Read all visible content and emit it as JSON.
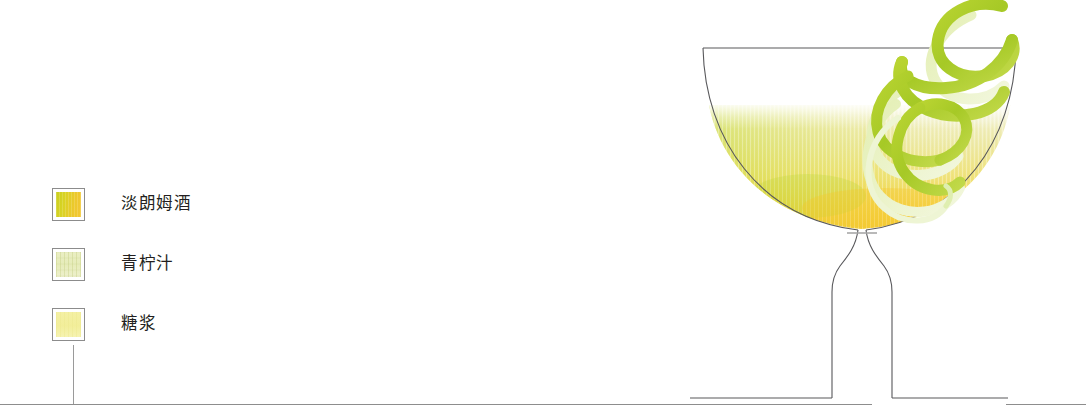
{
  "illustration": {
    "title": "Daiquiri cocktail cross-section illustration",
    "background_color": "#ffffff",
    "line_color": "#58585b"
  },
  "legend": {
    "items": [
      {
        "label": "淡朗姆酒",
        "swatch_name": "light-rum",
        "colors": [
          "#c9cf1f",
          "#d9d324",
          "#edc82c",
          "#f3c733"
        ],
        "border_color": "#8c8c8c"
      },
      {
        "label": "青柠汁",
        "swatch_name": "lime-juice",
        "colors": [
          "#eaeec4",
          "#e6ecb9",
          "#eef0cd"
        ],
        "border_color": "#8c8c8c"
      },
      {
        "label": "糖浆",
        "swatch_name": "syrup",
        "colors": [
          "#f4f0a4",
          "#f2ee9a",
          "#f6f3b2"
        ],
        "border_color": "#8c8c8c"
      }
    ]
  },
  "glass": {
    "name": "coupe-glass",
    "outline_color": "#58585b",
    "liquid": {
      "name": "cocktail-liquid",
      "surface_color": "#f3f2d2",
      "mid_color": "#edea92",
      "bottom_color": "#f6c62b",
      "green_tint": "#cbd93a"
    },
    "garnish": {
      "name": "lime-twist",
      "color": "#a9cc2b",
      "highlight_color": "#d6e87a"
    }
  },
  "baseline": {
    "name": "ground-line",
    "color": "#8d8d8d"
  },
  "leader_line": {
    "name": "legend-leader-line",
    "color": "#9a9a9a"
  }
}
